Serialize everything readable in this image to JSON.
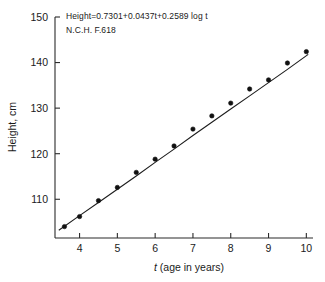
{
  "chart_data": {
    "type": "scatter",
    "title": "",
    "xlabel": "t (age in years)",
    "ylabel": "Height, cm",
    "xlim": [
      3.35,
      10.15
    ],
    "ylim": [
      101.5,
      150
    ],
    "xticks": [
      4,
      5,
      6,
      7,
      8,
      9,
      10
    ],
    "yticks": [
      110,
      120,
      130,
      140,
      150
    ],
    "xtick_labels": [
      "4",
      "5",
      "6",
      "7",
      "8",
      "9",
      "10"
    ],
    "ytick_labels": [
      "110",
      "120",
      "130",
      "140",
      "150"
    ],
    "grid": false,
    "legend": false,
    "x": [
      3.6,
      4.0,
      4.5,
      5.0,
      5.5,
      6.0,
      6.5,
      7.0,
      7.5,
      8.0,
      8.5,
      9.0,
      9.5,
      10.0
    ],
    "values": [
      104.0,
      106.2,
      109.7,
      112.6,
      115.9,
      118.8,
      121.7,
      125.4,
      128.3,
      131.1,
      134.2,
      136.2,
      139.9,
      142.4
    ],
    "series": [
      {
        "name": "observed heights",
        "marker": "filled-circle",
        "values": [
          104.0,
          106.2,
          109.7,
          112.6,
          115.9,
          118.8,
          121.7,
          125.4,
          128.3,
          131.1,
          134.2,
          136.2,
          139.9,
          142.4
        ]
      },
      {
        "name": "fitted curve",
        "marker": "none",
        "equation": "Height=0.7301+0.0437t+0.2589 log t",
        "fit_x": [
          3.45,
          4.0,
          4.5,
          5.0,
          5.5,
          6.0,
          6.5,
          7.0,
          7.5,
          8.0,
          8.5,
          9.0,
          9.5,
          10.05
        ],
        "fit_values": [
          103.2,
          106.4,
          109.3,
          112.2,
          115.1,
          118.1,
          121.0,
          124.0,
          126.9,
          129.8,
          132.7,
          135.6,
          138.5,
          141.8
        ]
      }
    ],
    "annotations": [
      {
        "id": "equation",
        "text": "Height=0.7301+0.0437t+0.2589 log t",
        "x": 4.0,
        "y": 148.2
      },
      {
        "id": "source",
        "text": "N.C.H. F.618",
        "x": 4.0,
        "y": 145.0
      }
    ],
    "colors": {
      "axis": "#2b2b2b",
      "marker": "#111111",
      "curve": "#1d1d1d",
      "background": "#ffffff",
      "text": "#1a1a1a"
    }
  }
}
